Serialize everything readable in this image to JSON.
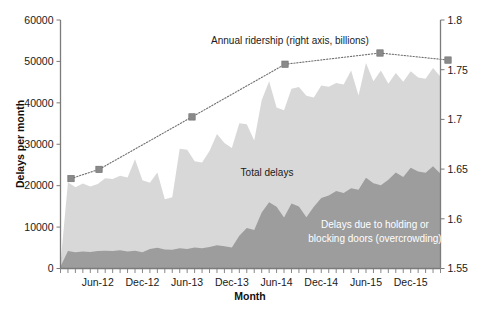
{
  "chart_data": {
    "type": "area",
    "title": "",
    "xlabel": "Month",
    "ylabel": "Delays per month",
    "y2label": "",
    "ylim": [
      0,
      60000
    ],
    "y2lim": [
      1.55,
      1.8
    ],
    "grid": false,
    "legend_position": "inline-annotations",
    "y_ticks": [
      "0",
      "10000",
      "20000",
      "30000",
      "40000",
      "50000",
      "60000"
    ],
    "y_tick_values": [
      0,
      10000,
      20000,
      30000,
      40000,
      50000,
      60000
    ],
    "y2_ticks": [
      "1.55",
      "1.6",
      "1.65",
      "1.7",
      "1.75",
      "1.8"
    ],
    "y2_tick_values": [
      1.55,
      1.6,
      1.65,
      1.7,
      1.75,
      1.8
    ],
    "x_tick_labels": [
      "Jun-12",
      "Dec-12",
      "Jun-13",
      "Dec-13",
      "Jun-14",
      "Dec-14",
      "Jun-15",
      "Dec-15"
    ],
    "x_tick_indices": [
      5,
      11,
      17,
      23,
      29,
      35,
      41,
      47
    ],
    "x_start_label": "Jan-12",
    "x_end_label": "Apr-16",
    "n_points": 52,
    "annotations": [
      {
        "id": "ridership-annotation",
        "text": "Annual ridership (right axis, billions)",
        "x": 290,
        "y": 44,
        "color": "#1a1a1a"
      },
      {
        "id": "total-delays-annotation",
        "text": "Total delays",
        "x": 267,
        "y": 176,
        "color": "#1a1a1a"
      },
      {
        "id": "doors-delays-annotation-line1",
        "text": "Delays due to holding or",
        "x": 375,
        "y": 228,
        "color": "#ffffff"
      },
      {
        "id": "doors-delays-annotation-line2",
        "text": "blocking doors (overcrowding)",
        "x": 375,
        "y": 242,
        "color": "#ffffff"
      }
    ],
    "series": [
      {
        "name": "Total delays",
        "type": "area",
        "axis": "left",
        "color": "#d8d8d8",
        "values": [
          1200,
          20800,
          19600,
          20500,
          19800,
          20400,
          21800,
          21600,
          22400,
          22000,
          26400,
          21300,
          20700,
          23200,
          16700,
          17200,
          28900,
          28700,
          25900,
          25600,
          28400,
          32500,
          30300,
          29100,
          35100,
          34800,
          30900,
          40600,
          45200,
          38900,
          38200,
          43400,
          43800,
          41700,
          41300,
          44200,
          43900,
          44800,
          44400,
          47800,
          41800,
          49600,
          45200,
          47800,
          44600,
          47200,
          45100,
          47600,
          46100,
          45800,
          48400,
          46300
        ]
      },
      {
        "name": "Delays due to holding or blocking doors (overcrowding)",
        "type": "area",
        "axis": "left",
        "color": "#9d9d9d",
        "values": [
          500,
          4200,
          3900,
          4100,
          4000,
          4200,
          4300,
          4200,
          4400,
          4100,
          4300,
          3900,
          4700,
          5000,
          4600,
          4500,
          4900,
          4700,
          5100,
          4900,
          5200,
          5600,
          5400,
          5100,
          7900,
          9800,
          9300,
          13500,
          16000,
          14900,
          12300,
          15700,
          15000,
          12400,
          14900,
          17000,
          17600,
          18700,
          18200,
          19400,
          19000,
          21900,
          20600,
          20100,
          21400,
          23200,
          22100,
          24300,
          23400,
          23100,
          24700,
          22900
        ]
      },
      {
        "name": "Annual ridership (right axis, billions)",
        "type": "line",
        "axis": "right",
        "color": "#8a8a8a",
        "marker": "square",
        "x_indices": [
          2,
          8,
          26,
          45,
          65,
          79
        ],
        "x_pixels": [
          71,
          99,
          192,
          285,
          380,
          448
        ],
        "values": [
          1.6405,
          1.6497,
          1.7025,
          1.7555,
          1.7668,
          1.7597
        ]
      }
    ]
  }
}
